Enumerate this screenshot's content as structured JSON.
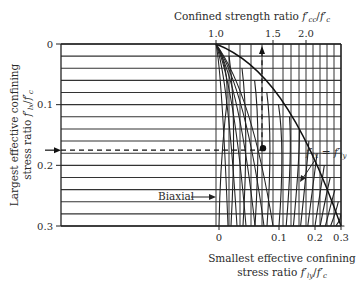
{
  "chart_data": {
    "type": "line",
    "top_axis": {
      "label": "Confined strength ratio f'cc/f'c",
      "ticks": [
        "1.0",
        "1.5",
        "2.0"
      ],
      "tick_values": [
        1.0,
        1.5,
        2.0
      ]
    },
    "left_axis": {
      "label_line1": "Largest effective confining",
      "label_line2": "stress ratio f'lx/f'c",
      "ticks": [
        "0",
        "0.1",
        "0.2",
        "0.3"
      ],
      "tick_values": [
        0,
        0.1,
        0.2,
        0.3
      ],
      "range": [
        0,
        0.3
      ],
      "inverted": true
    },
    "bottom_axis": {
      "label_line1": "Smallest effective confining",
      "label_line2": "stress ratio f'ly/f'c",
      "ticks": [
        "0",
        "0.1",
        "0.2",
        "0.3"
      ],
      "tick_values": [
        0,
        0.1,
        0.2,
        0.3
      ]
    },
    "grid": {
      "horizontal_step": 0.02,
      "horizontal_count": 16
    },
    "curves": {
      "description": "Family of curves for smallest confining stress ratio f'ly/f'c from 0 (biaxial) to 0.3, bounded by the f'lx = f'ly envelope",
      "ly_values": [
        0,
        0.02,
        0.04,
        0.06,
        0.08,
        0.1,
        0.12,
        0.14,
        0.16,
        0.18,
        0.2,
        0.22,
        0.24,
        0.26,
        0.28,
        0.3
      ]
    },
    "annotations": {
      "biaxial": "Biaxial",
      "equal_line": "f'lx = f'ly",
      "example_point": {
        "flx": 0.175,
        "fly": 0.07,
        "fcc_ratio": 1.63
      }
    },
    "xlabel": "Smallest effective confining stress ratio f'ly/f'c",
    "ylabel": "Largest effective confining stress ratio f'lx/f'c",
    "legend": "none"
  }
}
